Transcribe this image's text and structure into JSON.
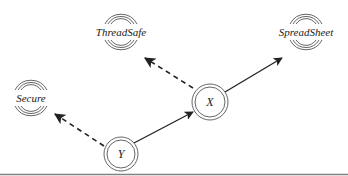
{
  "diagram": {
    "type": "directed-graph",
    "nodes": [
      {
        "id": "threadsafe",
        "label": "ThreadSafe",
        "style": "triple-arc",
        "cx": 121,
        "cy": 32
      },
      {
        "id": "spreadsheet",
        "label": "SpreadSheet",
        "style": "triple-arc",
        "cx": 306,
        "cy": 32
      },
      {
        "id": "secure",
        "label": "Secure",
        "style": "triple-arc",
        "cx": 31,
        "cy": 98
      },
      {
        "id": "x",
        "label": "X",
        "style": "double-circle",
        "cx": 210,
        "cy": 102
      },
      {
        "id": "y",
        "label": "Y",
        "style": "double-circle",
        "cx": 121,
        "cy": 154
      }
    ],
    "edges": [
      {
        "from": "y",
        "to": "x",
        "style": "solid"
      },
      {
        "from": "x",
        "to": "spreadsheet",
        "style": "solid"
      },
      {
        "from": "x",
        "to": "threadsafe",
        "style": "dashed"
      },
      {
        "from": "y",
        "to": "secure",
        "style": "dashed"
      }
    ],
    "colors": {
      "stroke": "#222222",
      "ring": "#555555",
      "baseline": "#808080",
      "background": "#ffffff"
    }
  }
}
